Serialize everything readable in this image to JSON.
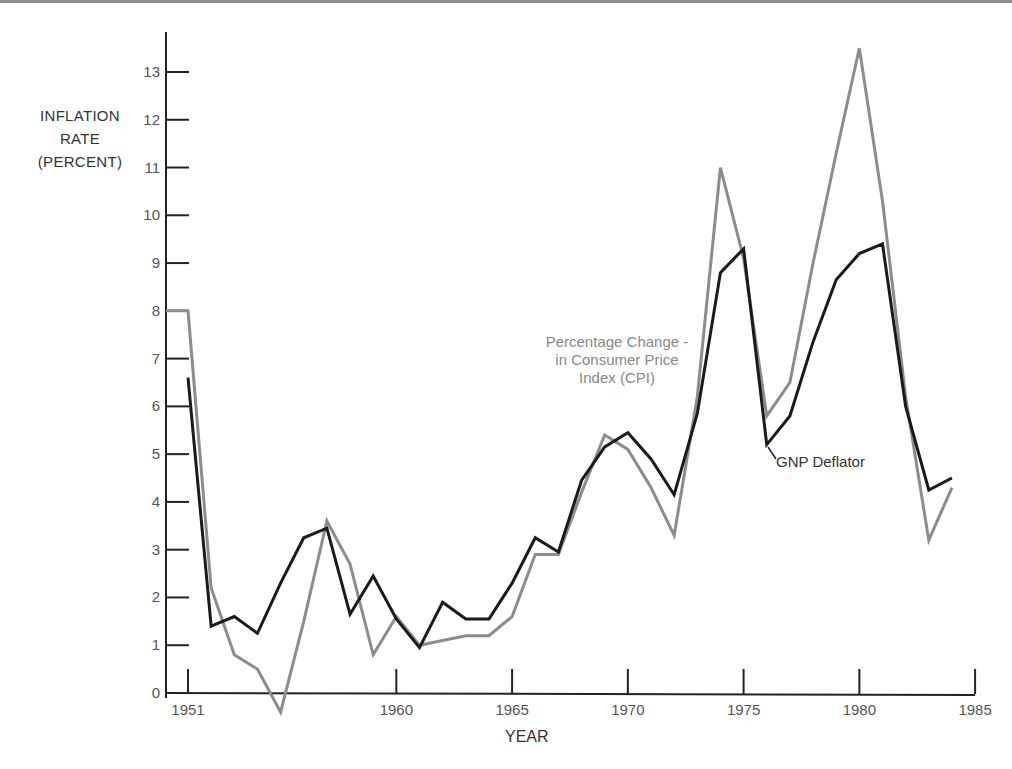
{
  "chart_data": {
    "type": "line",
    "title": "",
    "xlabel": "YEAR",
    "ylabel": "INFLATION RATE (PERCENT)",
    "ylabel_lines": [
      "INFLATION",
      "RATE",
      "(PERCENT)"
    ],
    "xlim": [
      1951,
      1985
    ],
    "ylim": [
      0,
      13
    ],
    "x_ticks": [
      1951,
      1960,
      1965,
      1970,
      1975,
      1980,
      1985
    ],
    "y_ticks": [
      0,
      1,
      2,
      3,
      4,
      5,
      6,
      7,
      8,
      9,
      10,
      11,
      12,
      13
    ],
    "grid": false,
    "x": [
      1951,
      1952,
      1953,
      1954,
      1955,
      1956,
      1957,
      1958,
      1959,
      1960,
      1961,
      1962,
      1963,
      1964,
      1965,
      1966,
      1967,
      1968,
      1969,
      1970,
      1971,
      1972,
      1973,
      1974,
      1975,
      1976,
      1977,
      1978,
      1979,
      1980,
      1981,
      1982,
      1983,
      1984
    ],
    "series": [
      {
        "name": "Percentage Change in Consumer Price Index (CPI)",
        "color": "#8c8c8c",
        "values": [
          8.0,
          2.2,
          0.8,
          0.5,
          -0.4,
          1.5,
          3.6,
          2.7,
          0.8,
          1.6,
          1.0,
          1.1,
          1.2,
          1.2,
          1.6,
          2.9,
          2.9,
          4.2,
          5.4,
          5.1,
          4.3,
          3.3,
          6.2,
          11.0,
          9.1,
          5.8,
          6.5,
          9.0,
          11.3,
          13.5,
          10.3,
          6.2,
          3.2,
          4.3
        ]
      },
      {
        "name": "GNP Deflator",
        "color": "#1a1a1a",
        "values": [
          6.6,
          1.4,
          1.6,
          1.25,
          2.3,
          3.25,
          3.45,
          1.65,
          2.45,
          1.55,
          0.95,
          1.9,
          1.55,
          1.55,
          2.3,
          3.25,
          2.95,
          4.45,
          5.15,
          5.45,
          4.9,
          4.15,
          5.85,
          8.8,
          9.3,
          5.2,
          5.8,
          7.35,
          8.65,
          9.2,
          9.4,
          6.0,
          4.25,
          4.5
        ]
      }
    ],
    "annotations": [
      {
        "text_lines": [
          "Percentage Change -",
          "in Consumer Price",
          "Index (CPI)"
        ],
        "series": "CPI"
      },
      {
        "text_lines": [
          "GNP Deflator"
        ],
        "series": "GNP Deflator"
      }
    ],
    "legend": "inline annotations"
  }
}
